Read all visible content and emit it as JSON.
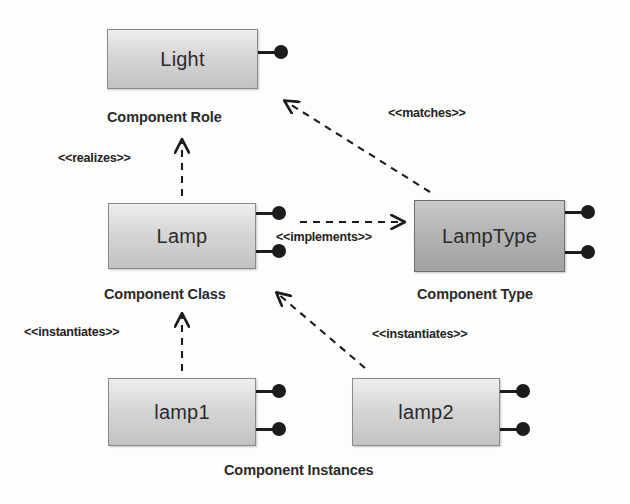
{
  "diagram": {
    "background_color": "#fdfdfb",
    "boxes": [
      {
        "id": "light",
        "label": "Light",
        "x": 107,
        "y": 29,
        "w": 151,
        "h": 60,
        "shade": "light",
        "ports": [
          {
            "cy": 23
          }
        ],
        "caption": "Component Role",
        "caption_x": 107,
        "caption_y": 109
      },
      {
        "id": "lamp",
        "label": "Lamp",
        "x": 108,
        "y": 203,
        "w": 148,
        "h": 66,
        "shade": "light",
        "ports": [
          {
            "cy": 10
          },
          {
            "cy": 48
          }
        ],
        "caption": "Component Class",
        "caption_x": 104,
        "caption_y": 286
      },
      {
        "id": "lamptype",
        "label": "LampType",
        "x": 414,
        "y": 200,
        "w": 151,
        "h": 72,
        "shade": "dark",
        "ports": [
          {
            "cy": 12
          },
          {
            "cy": 52
          }
        ],
        "caption": "Component Type",
        "caption_x": 417,
        "caption_y": 286
      },
      {
        "id": "lamp1",
        "label": "lamp1",
        "x": 108,
        "y": 378,
        "w": 148,
        "h": 68,
        "shade": "light",
        "ports": [
          {
            "cy": 13
          },
          {
            "cy": 51
          }
        ],
        "caption": "",
        "caption_x": 0,
        "caption_y": 0
      },
      {
        "id": "lamp2",
        "label": "lamp2",
        "x": 352,
        "y": 378,
        "w": 148,
        "h": 68,
        "shade": "light",
        "ports": [
          {
            "cy": 13
          },
          {
            "cy": 51
          }
        ],
        "caption": "",
        "caption_x": 0,
        "caption_y": 0
      }
    ],
    "shared_captions": [
      {
        "id": "component-instances",
        "text": "Component Instances",
        "x": 224,
        "y": 462
      }
    ],
    "relationships": [
      {
        "id": "realizes",
        "label": "« realizes »",
        "label_text": "<<realizes>>",
        "from": "lamp",
        "to": "light",
        "style": "dashed",
        "arrow": "open",
        "x1": 182,
        "y1": 196,
        "x2": 182,
        "y2": 140,
        "label_x": 58,
        "label_y": 151
      },
      {
        "id": "matches",
        "label_text": "<<matches>>",
        "from": "lamptype",
        "to": "light",
        "style": "dashed",
        "arrow": "open",
        "x1": 430,
        "y1": 192,
        "x2": 283,
        "y2": 100,
        "label_x": 388,
        "label_y": 106
      },
      {
        "id": "implements",
        "label_text": "<<implements>>",
        "from": "lamp",
        "to": "lamptype",
        "style": "dashed",
        "arrow": "open",
        "x1": 300,
        "y1": 222,
        "x2": 405,
        "y2": 222,
        "label_x": 276,
        "label_y": 230
      },
      {
        "id": "instantiates-lamp1",
        "label_text": "<<instantiates>>",
        "from": "lamp1",
        "to": "lamp",
        "style": "dashed",
        "arrow": "open",
        "x1": 182,
        "y1": 371,
        "x2": 182,
        "y2": 314,
        "label_x": 24,
        "label_y": 325
      },
      {
        "id": "instantiates-lamp2",
        "label_text": "<<instantiates>>",
        "from": "lamp2",
        "to": "lamp",
        "style": "dashed",
        "arrow": "open",
        "x1": 365,
        "y1": 368,
        "x2": 275,
        "y2": 292,
        "label_x": 372,
        "label_y": 327
      }
    ]
  }
}
